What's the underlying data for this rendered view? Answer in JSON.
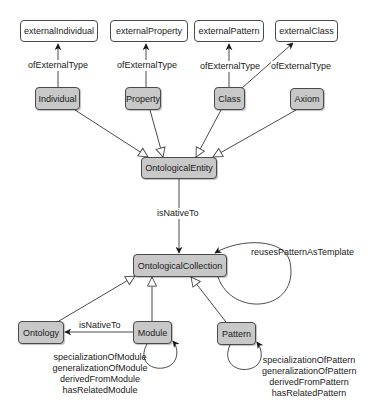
{
  "diagram": {
    "external_nodes": [
      {
        "id": "externalIndividual",
        "label": "externalIndividual"
      },
      {
        "id": "externalProperty",
        "label": "externalProperty"
      },
      {
        "id": "externalPattern",
        "label": "externalPattern"
      },
      {
        "id": "externalClass",
        "label": "externalClass"
      }
    ],
    "class_nodes": [
      {
        "id": "Individual",
        "label": "Individual"
      },
      {
        "id": "Property",
        "label": "Property"
      },
      {
        "id": "Class",
        "label": "Class"
      },
      {
        "id": "Axiom",
        "label": "Axiom"
      },
      {
        "id": "OntologicalEntity",
        "label": "OntologicalEntity"
      },
      {
        "id": "OntologicalCollection",
        "label": "OntologicalCollection"
      },
      {
        "id": "Ontology",
        "label": "Ontology"
      },
      {
        "id": "Module",
        "label": "Module"
      },
      {
        "id": "Pattern",
        "label": "Pattern"
      }
    ],
    "edge_labels": {
      "ofExternalType_1": "ofExternalType",
      "ofExternalType_2": "ofExternalType",
      "ofExternalType_3": "ofExternalType",
      "ofExternalType_4": "ofExternalType",
      "isNativeTo_entity": "isNativeTo",
      "reusesPatternAsTemplate": "reusesPatternAsTemplate",
      "isNativeTo_module": "isNativeTo"
    },
    "module_self_relations": [
      "specializationOfModule",
      "generalizationOfModule",
      "derivedFromModule",
      "hasRelatedModule"
    ],
    "pattern_self_relations": [
      "specializationOfPattern",
      "generalizationOfPattern",
      "derivedFromPattern",
      "hasRelatedPattern"
    ],
    "colors": {
      "class_fill": "#c8c8c8",
      "external_fill": "#ffffff",
      "stroke": "#4a4a4a"
    }
  }
}
